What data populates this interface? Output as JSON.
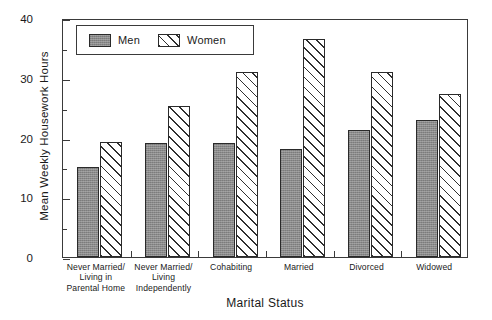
{
  "chart_data": {
    "type": "bar",
    "title": "",
    "xlabel": "Marital Status",
    "ylabel": "Mean Weekly Housework Hours",
    "ylim": [
      0,
      40
    ],
    "y_major_ticks": [
      0,
      10,
      20,
      30,
      40
    ],
    "y_minor_ticks": [
      5,
      15,
      25,
      35
    ],
    "y_tick_labels": [
      "0",
      "10",
      "20",
      "30",
      "40"
    ],
    "grid": false,
    "legend_position": "upper-left-inside",
    "categories": [
      "Never Married/ Living in Parental Home",
      "Never Married/ Living Independently",
      "Cohabiting",
      "Married",
      "Divorced",
      "Widowed"
    ],
    "category_lines": [
      [
        "Never Married/",
        "Living in",
        "Parental Home"
      ],
      [
        "Never Married/",
        "Living",
        "Independently"
      ],
      [
        "Cohabiting"
      ],
      [
        "Married"
      ],
      [
        "Divorced"
      ],
      [
        "Widowed"
      ]
    ],
    "series": [
      {
        "name": "Men",
        "fill": "solid-gray",
        "color": "#8a8a8a",
        "values": [
          15.0,
          19.0,
          19.0,
          18.0,
          21.2,
          23.0
        ]
      },
      {
        "name": "Women",
        "fill": "diagonal-hatch",
        "color": "#ffffff",
        "values": [
          19.3,
          25.2,
          31.0,
          36.5,
          31.0,
          27.2
        ]
      }
    ]
  },
  "legend": {
    "entries": [
      {
        "label": "Men"
      },
      {
        "label": "Women"
      }
    ]
  },
  "axes": {
    "y_title": "Mean Weekly Housework Hours",
    "x_title": "Marital Status"
  }
}
